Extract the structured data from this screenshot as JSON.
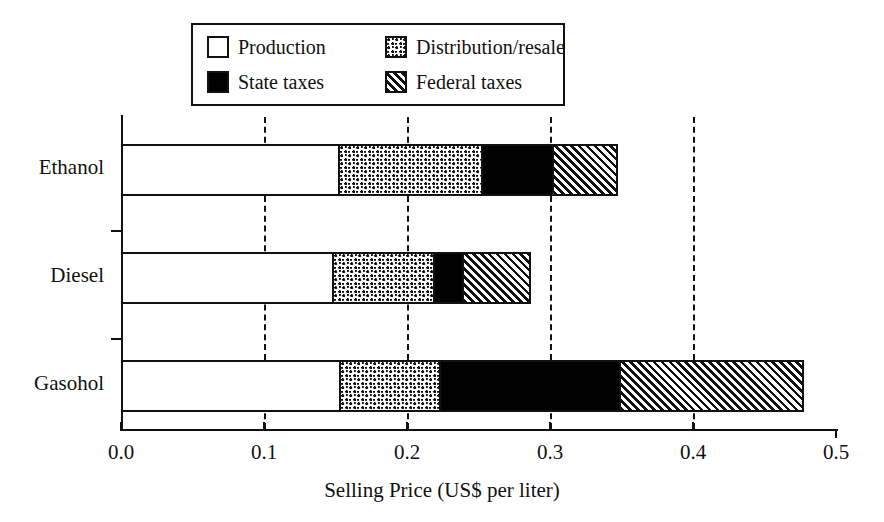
{
  "chart_data": {
    "type": "bar",
    "orientation": "horizontal",
    "stacked": true,
    "title": "",
    "xlabel": "Selling Price (US$ per liter)",
    "ylabel": "",
    "xlim": [
      0.0,
      0.5
    ],
    "xticks": [
      "0.0",
      "0.1",
      "0.2",
      "0.3",
      "0.4",
      "0.5"
    ],
    "xtick_values": [
      0.0,
      0.1,
      0.2,
      0.3,
      0.4,
      0.5
    ],
    "gridlines": [
      0.1,
      0.2,
      0.3,
      0.4
    ],
    "grid": "dashed-vertical",
    "legend_position": "top-center",
    "categories": [
      "Ethanol",
      "Diesel",
      "Gasohol"
    ],
    "series": [
      {
        "name": "Production",
        "fill": "white",
        "values": [
          0.15,
          0.146,
          0.151
        ]
      },
      {
        "name": "Distribution/resale",
        "fill": "dotted",
        "values": [
          0.1,
          0.071,
          0.07
        ]
      },
      {
        "name": "State taxes",
        "fill": "black",
        "values": [
          0.05,
          0.02,
          0.126
        ]
      },
      {
        "name": "Federal taxes",
        "fill": "diagonal-hatch",
        "values": [
          0.045,
          0.047,
          0.128
        ]
      }
    ],
    "totals": [
      0.345,
      0.284,
      0.475
    ]
  },
  "legend": {
    "items": [
      {
        "label": "Production",
        "swatch": "white-square-icon"
      },
      {
        "label": "Distribution/resale",
        "swatch": "dotted-square-icon"
      },
      {
        "label": "State taxes",
        "swatch": "black-square-icon"
      },
      {
        "label": "Federal taxes",
        "swatch": "hatched-square-icon"
      }
    ]
  },
  "axis": {
    "x_title": "Selling Price (US$ per liter)"
  },
  "colors": {
    "ink": "#111111",
    "background": "#ffffff"
  }
}
